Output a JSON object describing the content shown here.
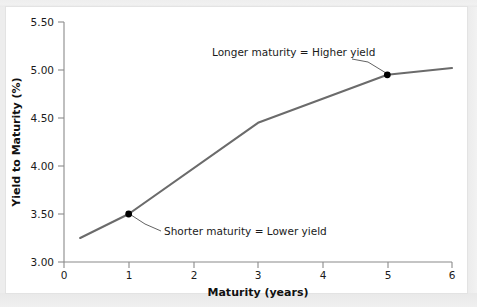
{
  "figure": {
    "background_color": "#efefef",
    "plate_color": "#ffffff"
  },
  "chart_data": {
    "type": "line",
    "title": "",
    "subtitle": "",
    "xlabel": "Maturity (years)",
    "ylabel": "Yield to Maturity (%)",
    "xlim": [
      0,
      6
    ],
    "ylim": [
      3.0,
      5.5
    ],
    "xticks": [
      0,
      1,
      2,
      3,
      4,
      5,
      6
    ],
    "xtick_labels": [
      "0",
      "1",
      "2",
      "3",
      "4",
      "5",
      "6"
    ],
    "yticks": [
      3.0,
      3.5,
      4.0,
      4.5,
      5.0,
      5.5
    ],
    "ytick_labels": [
      "3.00",
      "3.50",
      "4.00",
      "4.50",
      "5.00",
      "5.50"
    ],
    "grid": false,
    "legend": null,
    "legend_position": "none",
    "line_color": "#6b6b6b",
    "marker_color": "#000000",
    "series": [
      {
        "name": "Yield curve",
        "x": [
          0.25,
          1.0,
          3.0,
          5.0,
          6.0
        ],
        "y": [
          3.25,
          3.5,
          4.45,
          4.95,
          5.02
        ]
      }
    ],
    "markers": [
      {
        "label": "Shorter maturity point",
        "x": 1.0,
        "y": 3.5
      },
      {
        "label": "Longer maturity point",
        "x": 5.0,
        "y": 4.95
      }
    ],
    "annotations": [
      {
        "id": "longer-maturity",
        "text": "Longer maturity = Higher yield",
        "text_x": 2.0,
        "text_y": 5.2,
        "points_to_x": 5.0,
        "points_to_y": 4.95
      },
      {
        "id": "shorter-maturity",
        "text": "Shorter maturity = Lower yield",
        "text_x": 1.55,
        "text_y": 3.28,
        "points_to_x": 1.0,
        "points_to_y": 3.5
      }
    ]
  }
}
